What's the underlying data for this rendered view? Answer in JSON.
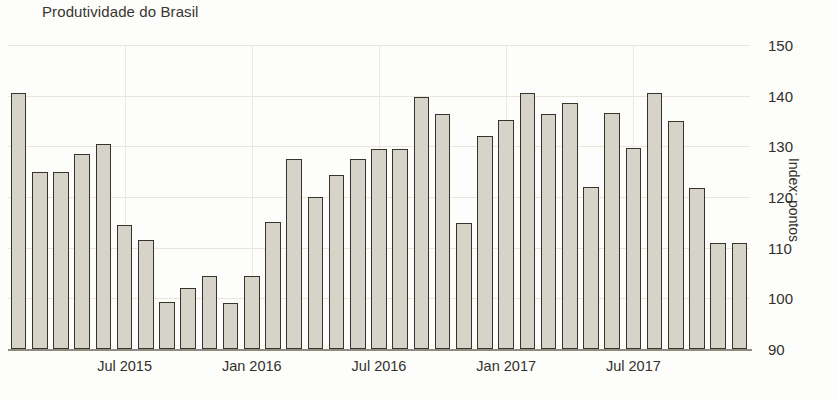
{
  "chart_data": {
    "type": "bar",
    "title": "Produtividade do Brasil",
    "xlabel": "",
    "ylabel": "Index: pontos",
    "ylim": [
      90,
      150
    ],
    "yticks": [
      90,
      100,
      110,
      120,
      130,
      140,
      150
    ],
    "grid": true,
    "legend": null,
    "bar_color": "#d6d4c8",
    "bar_edge_color": "#37342c",
    "x_tick_labels": [
      "Jul 2015",
      "Jan 2016",
      "Jul 2016",
      "Jan 2017",
      "Jul 2017"
    ],
    "x_tick_indices": [
      5,
      11,
      17,
      23,
      29
    ],
    "categories": [
      "Feb 2015",
      "Mar 2015",
      "Apr 2015",
      "May 2015",
      "Jun 2015",
      "Jul 2015",
      "Aug 2015",
      "Sep 2015",
      "Oct 2015",
      "Nov 2015",
      "Dec 2015",
      "Jan 2016",
      "Feb 2016",
      "Mar 2016",
      "Apr 2016",
      "May 2016",
      "Jun 2016",
      "Jul 2016",
      "Aug 2016",
      "Sep 2016",
      "Oct 2016",
      "Nov 2016",
      "Dec 2016",
      "Jan 2017",
      "Feb 2017",
      "Mar 2017",
      "Apr 2017",
      "May 2017",
      "Jun 2017",
      "Jul 2017",
      "Aug 2017",
      "Sep 2017",
      "Oct 2017",
      "Nov 2017",
      "Dec 2017"
    ],
    "values": [
      140.5,
      125.0,
      125.0,
      128.5,
      130.5,
      114.5,
      111.5,
      99.3,
      102.0,
      104.5,
      99.0,
      104.5,
      115.0,
      127.5,
      120.0,
      124.3,
      127.5,
      129.5,
      129.5,
      139.7,
      136.4,
      114.8,
      132.0,
      135.2,
      140.5,
      136.4,
      138.6,
      122.0,
      136.6,
      129.7,
      140.5,
      135.0,
      121.8,
      110.9,
      110.9
    ]
  },
  "axis": {
    "y_title": "Index: pontos"
  }
}
